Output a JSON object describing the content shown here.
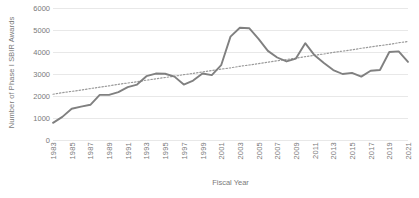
{
  "chart_data": {
    "type": "line",
    "title": "",
    "xlabel": "Fiscal Year",
    "ylabel": "Number of Phase I SBIR Awards",
    "ylim": [
      0,
      6000
    ],
    "ytick_labels": [
      "0",
      "1000",
      "2000",
      "3000",
      "4000",
      "5000",
      "6000"
    ],
    "ytick_values": [
      0,
      1000,
      2000,
      3000,
      4000,
      5000,
      6000
    ],
    "xtick_labels": [
      "1983",
      "1985",
      "1987",
      "1989",
      "1991",
      "1993",
      "1995",
      "1997",
      "1999",
      "2001",
      "2003",
      "2005",
      "2007",
      "2009",
      "2011",
      "2013",
      "2015",
      "2017",
      "2019",
      "2021"
    ],
    "grid": "horizontal",
    "legend": "none",
    "x": [
      1983,
      1984,
      1985,
      1986,
      1987,
      1988,
      1989,
      1990,
      1991,
      1992,
      1993,
      1994,
      1995,
      1996,
      1997,
      1998,
      1999,
      2000,
      2001,
      2002,
      2003,
      2004,
      2005,
      2006,
      2007,
      2008,
      2009,
      2010,
      2011,
      2012,
      2013,
      2014,
      2015,
      2016,
      2017,
      2018,
      2019,
      2020,
      2021
    ],
    "series": [
      {
        "name": "Phase I SBIR Awards",
        "style": "solid",
        "color": "#808080",
        "values": [
          780,
          1050,
          1420,
          1520,
          1600,
          2050,
          2050,
          2180,
          2400,
          2520,
          2900,
          3020,
          3010,
          2880,
          2520,
          2700,
          3020,
          2950,
          3400,
          4700,
          5100,
          5080,
          4600,
          4050,
          3750,
          3570,
          3700,
          4400,
          3850,
          3500,
          3180,
          3000,
          3050,
          2880,
          3150,
          3180,
          4000,
          4030,
          3550
        ]
      },
      {
        "name": "Linear trend",
        "style": "dotted",
        "color": "#9a9a9a",
        "values": [
          2080,
          2150,
          2210,
          2270,
          2340,
          2400,
          2460,
          2530,
          2590,
          2650,
          2720,
          2780,
          2840,
          2900,
          2970,
          3030,
          3090,
          3160,
          3220,
          3280,
          3350,
          3410,
          3470,
          3540,
          3600,
          3660,
          3720,
          3790,
          3850,
          3910,
          3980,
          4040,
          4100,
          4170,
          4230,
          4290,
          4350,
          4420,
          4480
        ]
      }
    ]
  }
}
